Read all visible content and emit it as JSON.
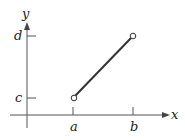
{
  "diagram": {
    "axes": {
      "x_label": "x",
      "y_label": "y"
    },
    "ticks": {
      "x": [
        {
          "label": "a"
        },
        {
          "label": "b"
        }
      ],
      "y": [
        {
          "label": "c"
        },
        {
          "label": "d"
        }
      ]
    },
    "segment": {
      "start": {
        "x": "a",
        "y": "c",
        "endpoint": "open"
      },
      "end": {
        "x": "b",
        "y": "d",
        "endpoint": "open"
      }
    },
    "colors": {
      "line": "#333333",
      "axis": "#444444"
    }
  }
}
